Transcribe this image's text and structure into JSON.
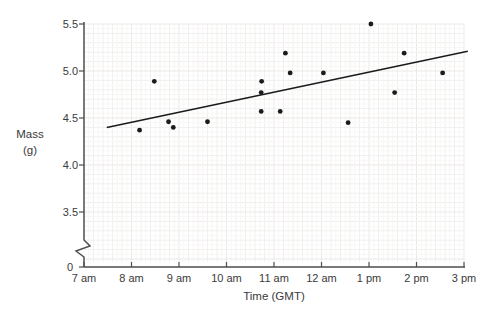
{
  "figure": {
    "background": "#ffffff"
  },
  "chart_data": {
    "type": "scatter",
    "title": "",
    "xlabel": "Time (GMT)",
    "ylabel": "Mass (g)",
    "ylabel_lines": [
      "Mass",
      "(g)"
    ],
    "legend": false,
    "grid": true,
    "x_axis": {
      "unit": "hour of day",
      "range_hours": [
        7,
        15
      ],
      "ticks": [
        {
          "hour": 7,
          "label": "7 am"
        },
        {
          "hour": 8,
          "label": "8 am"
        },
        {
          "hour": 9,
          "label": "9 am"
        },
        {
          "hour": 10,
          "label": "10 am"
        },
        {
          "hour": 11,
          "label": "11 am"
        },
        {
          "hour": 12,
          "label": "12 am"
        },
        {
          "hour": 13,
          "label": "1 pm"
        },
        {
          "hour": 14,
          "label": "2 pm"
        },
        {
          "hour": 15,
          "label": "3 pm"
        }
      ]
    },
    "y_axis": {
      "range": [
        3.5,
        5.5
      ],
      "axis_break_above_zero": true,
      "ticks": [
        {
          "value": 5.5,
          "label": "5.5"
        },
        {
          "value": 5.0,
          "label": "5.0"
        },
        {
          "value": 4.5,
          "label": "4.5"
        },
        {
          "value": 4.0,
          "label": "4.0"
        },
        {
          "value": 3.5,
          "label": "3.5"
        },
        {
          "value": 0,
          "label": "0"
        }
      ]
    },
    "points": [
      {
        "time": "8:10 am",
        "hour": 8.17,
        "mass": 4.37
      },
      {
        "time": "8:30 am",
        "hour": 8.48,
        "mass": 4.89
      },
      {
        "time": "8:45 am",
        "hour": 8.78,
        "mass": 4.46
      },
      {
        "time": "8:55 am",
        "hour": 8.88,
        "mass": 4.4
      },
      {
        "time": "9:35 am",
        "hour": 9.6,
        "mass": 4.46
      },
      {
        "time": "10:45 am",
        "hour": 10.74,
        "mass": 4.89
      },
      {
        "time": "10:45 am",
        "hour": 10.73,
        "mass": 4.77
      },
      {
        "time": "10:45 am",
        "hour": 10.73,
        "mass": 4.57
      },
      {
        "time": "11:10 am",
        "hour": 11.13,
        "mass": 4.57
      },
      {
        "time": "11:15 am",
        "hour": 11.24,
        "mass": 5.19
      },
      {
        "time": "11:20 am",
        "hour": 11.34,
        "mass": 4.98
      },
      {
        "time": "12:00 pm",
        "hour": 12.04,
        "mass": 4.98
      },
      {
        "time": "12:35 pm",
        "hour": 12.56,
        "mass": 4.45
      },
      {
        "time": "1:00 pm",
        "hour": 13.04,
        "mass": 5.5
      },
      {
        "time": "1:30 pm",
        "hour": 13.54,
        "mass": 4.77
      },
      {
        "time": "1:45 pm",
        "hour": 13.74,
        "mass": 5.19
      },
      {
        "time": "2:35 pm",
        "hour": 14.55,
        "mass": 4.98
      }
    ],
    "trend_line": {
      "x1_hour": 7.48,
      "y1_mass": 4.4,
      "x2_hour": 15.08,
      "y2_mass": 5.21
    },
    "colors": {
      "point": "#1b1b1b",
      "trend_line": "#1b1b1b",
      "axis": "#4d4d4d",
      "text": "#3a3a3a",
      "grid_minor": "#f8f7f6",
      "grid_mid": "#f1f0ee",
      "grid_major": "#ebe9e7"
    }
  }
}
